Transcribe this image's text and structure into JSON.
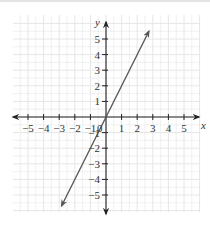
{
  "chart_data": {
    "type": "line",
    "title": "",
    "xlabel": "x",
    "ylabel": "y",
    "xlim": [
      -5,
      5
    ],
    "ylim": [
      -5,
      5
    ],
    "grid": true,
    "origin_label": "0",
    "x_ticks": [
      -5,
      -4,
      -3,
      -2,
      -1,
      1,
      2,
      3,
      4,
      5
    ],
    "x_tick_labels": [
      "−5",
      "−4",
      "−3",
      "−2",
      "−1",
      "1",
      "2",
      "3",
      "4",
      "5"
    ],
    "y_ticks": [
      5,
      4,
      3,
      2,
      1,
      -1,
      -2,
      -3,
      -4,
      -5
    ],
    "y_tick_labels": [
      "5",
      "4",
      "3",
      "2",
      "1",
      "−1",
      "−2",
      "−3",
      "−4",
      "−5"
    ],
    "series": [
      {
        "name": "y = 2x",
        "equation": "y = 2x",
        "x": [
          -2.85,
          2.75
        ],
        "y": [
          -5.7,
          5.5
        ],
        "arrows_both_ends": true,
        "color": "#555555"
      }
    ],
    "colors": {
      "axis": "#222222",
      "grid": "#e6e6e6",
      "line": "#555555"
    }
  }
}
